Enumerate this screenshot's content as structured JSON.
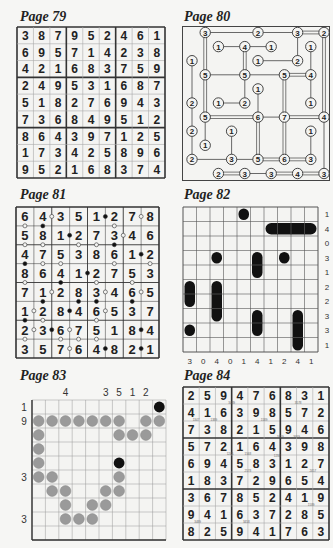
{
  "pages": [
    {
      "id": "p79",
      "title": "Page 79",
      "type": "sudoku"
    },
    {
      "id": "p80",
      "title": "Page 80",
      "type": "hashi"
    },
    {
      "id": "p81",
      "title": "Page 81",
      "type": "kropki"
    },
    {
      "id": "p82",
      "title": "Page 82",
      "type": "battleships"
    },
    {
      "id": "p83",
      "title": "Page 83",
      "type": "nonogram-path"
    },
    {
      "id": "p84",
      "title": "Page 84",
      "type": "sudoku-killer-clues"
    }
  ],
  "p79": {
    "title": "Page 79",
    "grid": [
      [
        3,
        8,
        7,
        9,
        5,
        2,
        4,
        6,
        1
      ],
      [
        6,
        9,
        5,
        7,
        1,
        4,
        2,
        3,
        8
      ],
      [
        4,
        2,
        1,
        6,
        8,
        3,
        7,
        5,
        9
      ],
      [
        2,
        4,
        9,
        5,
        3,
        1,
        6,
        8,
        7
      ],
      [
        5,
        1,
        8,
        2,
        7,
        6,
        9,
        4,
        3
      ],
      [
        7,
        3,
        6,
        8,
        4,
        9,
        5,
        1,
        2
      ],
      [
        8,
        6,
        4,
        3,
        9,
        7,
        1,
        2,
        5
      ],
      [
        1,
        7,
        3,
        4,
        2,
        5,
        8,
        9,
        6
      ],
      [
        9,
        5,
        2,
        1,
        6,
        8,
        3,
        7,
        4
      ]
    ]
  },
  "p80": {
    "title": "Page 80",
    "nodes": [
      {
        "r": 0,
        "c": 1,
        "v": 3
      },
      {
        "r": 0,
        "c": 5,
        "v": 2
      },
      {
        "r": 0,
        "c": 8,
        "v": 3
      },
      {
        "r": 0,
        "c": 10,
        "v": 2
      },
      {
        "r": 1,
        "c": 2,
        "v": 1
      },
      {
        "r": 1,
        "c": 4,
        "v": 4
      },
      {
        "r": 1,
        "c": 6,
        "v": 1
      },
      {
        "r": 1,
        "c": 9,
        "v": 1
      },
      {
        "r": 2,
        "c": 0,
        "v": 1
      },
      {
        "r": 2,
        "c": 5,
        "v": 1
      },
      {
        "r": 2,
        "c": 8,
        "v": 2
      },
      {
        "r": 3,
        "c": 1,
        "v": 5
      },
      {
        "r": 3,
        "c": 4,
        "v": 5
      },
      {
        "r": 3,
        "c": 7,
        "v": 5
      },
      {
        "r": 3,
        "c": 9,
        "v": 4
      },
      {
        "r": 4,
        "c": 5,
        "v": 1
      },
      {
        "r": 5,
        "c": 0,
        "v": 2
      },
      {
        "r": 5,
        "c": 2,
        "v": 1
      },
      {
        "r": 5,
        "c": 4,
        "v": 2
      },
      {
        "r": 5,
        "c": 9,
        "v": 1
      },
      {
        "r": 6,
        "c": 1,
        "v": 5
      },
      {
        "r": 6,
        "c": 5,
        "v": 6
      },
      {
        "r": 6,
        "c": 7,
        "v": 7
      },
      {
        "r": 6,
        "c": 10,
        "v": 4
      },
      {
        "r": 7,
        "c": 0,
        "v": 2
      },
      {
        "r": 7,
        "c": 3,
        "v": 1
      },
      {
        "r": 7,
        "c": 9,
        "v": 1
      },
      {
        "r": 8,
        "c": 1,
        "v": 1
      },
      {
        "r": 9,
        "c": 0,
        "v": 2
      },
      {
        "r": 9,
        "c": 3,
        "v": 3
      },
      {
        "r": 9,
        "c": 5,
        "v": 5
      },
      {
        "r": 9,
        "c": 7,
        "v": 6
      },
      {
        "r": 9,
        "c": 9,
        "v": 3
      },
      {
        "r": 10,
        "c": 2,
        "v": 2
      },
      {
        "r": 10,
        "c": 4,
        "v": 3
      },
      {
        "r": 10,
        "c": 6,
        "v": 3
      },
      {
        "r": 10,
        "c": 8,
        "v": 4
      },
      {
        "r": 10,
        "c": 10,
        "v": 3
      }
    ],
    "bridges": [
      [
        0,
        1,
        0,
        5,
        1
      ],
      [
        0,
        5,
        0,
        8,
        1
      ],
      [
        0,
        8,
        0,
        10,
        2
      ],
      [
        0,
        1,
        3,
        1,
        2
      ],
      [
        1,
        2,
        1,
        4,
        1
      ],
      [
        1,
        4,
        1,
        6,
        1
      ],
      [
        1,
        4,
        3,
        4,
        2
      ],
      [
        0,
        8,
        2,
        8,
        1
      ],
      [
        2,
        5,
        2,
        8,
        1
      ],
      [
        1,
        9,
        3,
        9,
        1
      ],
      [
        2,
        0,
        5,
        0,
        1
      ],
      [
        3,
        1,
        3,
        4,
        1
      ],
      [
        3,
        4,
        3,
        7,
        1
      ],
      [
        3,
        7,
        3,
        9,
        2
      ],
      [
        3,
        4,
        5,
        4,
        1
      ],
      [
        3,
        9,
        5,
        9,
        1
      ],
      [
        3,
        7,
        6,
        7,
        2
      ],
      [
        4,
        5,
        6,
        5,
        1
      ],
      [
        5,
        2,
        5,
        4,
        1
      ],
      [
        3,
        1,
        6,
        1,
        2
      ],
      [
        5,
        0,
        7,
        0,
        1
      ],
      [
        6,
        1,
        6,
        5,
        2
      ],
      [
        6,
        5,
        6,
        7,
        1
      ],
      [
        6,
        7,
        6,
        10,
        2
      ],
      [
        6,
        1,
        8,
        1,
        1
      ],
      [
        6,
        5,
        9,
        5,
        2
      ],
      [
        6,
        7,
        9,
        7,
        2
      ],
      [
        0,
        10,
        6,
        10,
        2
      ],
      [
        6,
        10,
        10,
        10,
        1
      ],
      [
        7,
        3,
        9,
        3,
        1
      ],
      [
        7,
        9,
        9,
        9,
        1
      ],
      [
        7,
        0,
        9,
        0,
        1
      ],
      [
        9,
        0,
        9,
        3,
        1
      ],
      [
        9,
        3,
        9,
        5,
        1
      ],
      [
        9,
        5,
        9,
        7,
        2
      ],
      [
        9,
        7,
        9,
        9,
        2
      ],
      [
        10,
        2,
        10,
        4,
        2
      ],
      [
        10,
        4,
        10,
        6,
        1
      ],
      [
        10,
        6,
        10,
        8,
        2
      ],
      [
        10,
        8,
        10,
        10,
        2
      ]
    ]
  },
  "p81": {
    "title": "Page 81",
    "grid": [
      [
        6,
        4,
        3,
        5,
        1,
        2,
        7,
        8
      ],
      [
        5,
        8,
        1,
        2,
        7,
        3,
        4,
        6
      ],
      [
        4,
        7,
        5,
        3,
        8,
        6,
        1,
        2
      ],
      [
        8,
        6,
        4,
        1,
        2,
        7,
        5,
        3
      ],
      [
        7,
        1,
        2,
        8,
        3,
        4,
        6,
        5
      ],
      [
        1,
        2,
        8,
        4,
        6,
        5,
        3,
        7
      ],
      [
        2,
        3,
        6,
        7,
        5,
        1,
        8,
        4
      ],
      [
        3,
        5,
        7,
        6,
        4,
        8,
        2,
        1
      ]
    ],
    "h_dots": [
      [
        0,
        1,
        "w"
      ],
      [
        0,
        4,
        "b"
      ],
      [
        0,
        6,
        "w"
      ],
      [
        1,
        2,
        "b"
      ],
      [
        1,
        5,
        "w"
      ],
      [
        2,
        6,
        "b"
      ],
      [
        3,
        3,
        "b"
      ],
      [
        4,
        1,
        "w"
      ],
      [
        4,
        4,
        "w"
      ],
      [
        4,
        6,
        "w"
      ],
      [
        5,
        0,
        "w"
      ],
      [
        5,
        2,
        "b"
      ],
      [
        5,
        4,
        "w"
      ],
      [
        6,
        0,
        "w"
      ],
      [
        6,
        1,
        "b"
      ],
      [
        6,
        2,
        "w"
      ],
      [
        6,
        6,
        "b"
      ],
      [
        7,
        2,
        "w"
      ],
      [
        7,
        4,
        "b"
      ],
      [
        7,
        6,
        "b"
      ]
    ],
    "v_dots": [
      [
        0,
        0,
        "w"
      ],
      [
        0,
        1,
        "b"
      ],
      [
        0,
        5,
        "w"
      ],
      [
        1,
        0,
        "w"
      ],
      [
        1,
        1,
        "w"
      ],
      [
        1,
        3,
        "w"
      ],
      [
        1,
        4,
        "w"
      ],
      [
        1,
        5,
        "b"
      ],
      [
        2,
        0,
        "b"
      ],
      [
        2,
        1,
        "w"
      ],
      [
        2,
        2,
        "w"
      ],
      [
        2,
        5,
        "w"
      ],
      [
        2,
        7,
        "w"
      ],
      [
        3,
        0,
        "w"
      ],
      [
        3,
        2,
        "b"
      ],
      [
        3,
        4,
        "w"
      ],
      [
        3,
        6,
        "w"
      ],
      [
        4,
        1,
        "b"
      ],
      [
        4,
        3,
        "b"
      ],
      [
        4,
        4,
        "b"
      ],
      [
        4,
        6,
        "b"
      ],
      [
        5,
        0,
        "b"
      ],
      [
        5,
        1,
        "w"
      ],
      [
        5,
        4,
        "w"
      ],
      [
        6,
        0,
        "w"
      ],
      [
        6,
        2,
        "w"
      ],
      [
        6,
        3,
        "w"
      ],
      [
        6,
        4,
        "w"
      ]
    ]
  },
  "p82": {
    "title": "Page 82",
    "row_clues": [
      1,
      4,
      0,
      3,
      1,
      2,
      2,
      3,
      3,
      1
    ],
    "col_clues": [
      3,
      0,
      4,
      0,
      1,
      4,
      1,
      2,
      4,
      1
    ],
    "ships": [
      {
        "r": 0,
        "c": 4,
        "len": 1,
        "dir": "h"
      },
      {
        "r": 1,
        "c": 6,
        "len": 4,
        "dir": "h"
      },
      {
        "r": 3,
        "c": 2,
        "len": 1,
        "dir": "h"
      },
      {
        "r": 3,
        "c": 5,
        "len": 2,
        "dir": "v"
      },
      {
        "r": 3,
        "c": 7,
        "len": 1,
        "dir": "h"
      },
      {
        "r": 5,
        "c": 0,
        "len": 2,
        "dir": "v"
      },
      {
        "r": 5,
        "c": 2,
        "len": 3,
        "dir": "v"
      },
      {
        "r": 7,
        "c": 5,
        "len": 2,
        "dir": "v"
      },
      {
        "r": 7,
        "c": 8,
        "len": 3,
        "dir": "v"
      },
      {
        "r": 8,
        "c": 0,
        "len": 1,
        "dir": "h"
      }
    ]
  },
  "p83": {
    "title": "Page 83",
    "col_clues": [
      {
        "c": 2,
        "v": "4"
      },
      {
        "c": 5,
        "v": "3"
      },
      {
        "c": 6,
        "v": "5"
      },
      {
        "c": 7,
        "v": "1"
      },
      {
        "c": 8,
        "v": "2"
      }
    ],
    "row_clues": [
      {
        "r": 0,
        "v": "1"
      },
      {
        "r": 1,
        "v": "9"
      },
      {
        "r": 5,
        "v": "3"
      },
      {
        "r": 8,
        "v": "3"
      }
    ],
    "black": [
      [
        0,
        9
      ],
      [
        4,
        6
      ]
    ],
    "gray": [
      [
        1,
        0
      ],
      [
        1,
        1
      ],
      [
        1,
        2
      ],
      [
        1,
        3
      ],
      [
        1,
        4
      ],
      [
        1,
        5
      ],
      [
        1,
        6
      ],
      [
        1,
        8
      ],
      [
        1,
        9
      ],
      [
        2,
        0
      ],
      [
        2,
        6
      ],
      [
        2,
        7
      ],
      [
        2,
        8
      ],
      [
        3,
        0
      ],
      [
        4,
        0
      ],
      [
        5,
        0
      ],
      [
        5,
        1
      ],
      [
        5,
        6
      ],
      [
        6,
        1
      ],
      [
        6,
        2
      ],
      [
        6,
        5
      ],
      [
        6,
        6
      ],
      [
        7,
        2
      ],
      [
        7,
        4
      ],
      [
        7,
        5
      ],
      [
        8,
        2
      ],
      [
        8,
        3
      ],
      [
        8,
        4
      ]
    ]
  },
  "p84": {
    "title": "Page 84",
    "grid": [
      [
        2,
        5,
        9,
        4,
        7,
        6,
        8,
        3,
        1
      ],
      [
        4,
        1,
        6,
        3,
        9,
        8,
        5,
        7,
        2
      ],
      [
        7,
        3,
        8,
        2,
        1,
        5,
        9,
        4,
        6
      ],
      [
        5,
        7,
        2,
        1,
        6,
        4,
        3,
        9,
        8
      ],
      [
        6,
        9,
        4,
        5,
        8,
        3,
        1,
        2,
        7
      ],
      [
        1,
        8,
        3,
        7,
        2,
        9,
        6,
        5,
        4
      ],
      [
        3,
        6,
        7,
        8,
        5,
        2,
        4,
        1,
        9
      ],
      [
        9,
        4,
        1,
        6,
        3,
        7,
        2,
        8,
        5
      ],
      [
        8,
        2,
        5,
        9,
        4,
        1,
        7,
        6,
        3
      ]
    ],
    "small_clues": [
      {
        "x": 3.0,
        "y": 0.95,
        "t": "3489"
      },
      {
        "x": 7.1,
        "y": 0.95,
        "t": "3578"
      },
      {
        "x": 0.8,
        "y": 1.95,
        "t": "1347"
      },
      {
        "x": 1.9,
        "y": 1.95,
        "t": "1389"
      },
      {
        "x": 5.0,
        "y": 1.95,
        "t": "1589"
      },
      {
        "x": 6.0,
        "y": 2.95,
        "t": "3459"
      },
      {
        "x": 7.0,
        "y": 2.95,
        "t": "3469"
      },
      {
        "x": 2.9,
        "y": 3.95,
        "t": "1245"
      },
      {
        "x": 4.0,
        "y": 3.95,
        "t": "1568"
      },
      {
        "x": 5.8,
        "y": 4.05,
        "t": "1234"
      },
      {
        "x": 4.0,
        "y": 4.95,
        "t": "2578"
      },
      {
        "x": 8.0,
        "y": 4.95,
        "t": "2457"
      },
      {
        "x": 7.9,
        "y": 6.95,
        "t": "1589"
      },
      {
        "x": 0.9,
        "y": 7.95,
        "t": "3489"
      },
      {
        "x": 3.9,
        "y": 7.95,
        "t": "3458"
      }
    ]
  }
}
